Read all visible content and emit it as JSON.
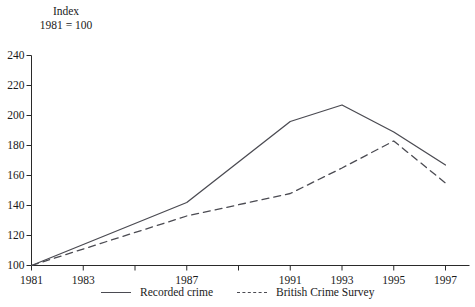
{
  "chart_data": {
    "type": "line",
    "title": "",
    "axis_title_lines": [
      "Index",
      "1981 = 100"
    ],
    "xlabel": "",
    "ylabel": "Index 1981 = 100",
    "ylim": [
      100,
      240
    ],
    "xlim": [
      1981,
      1997
    ],
    "grid": false,
    "legend_position": "bottom",
    "y_ticks": [
      240,
      220,
      200,
      180,
      160,
      140,
      120,
      100
    ],
    "x_ticks": [
      1981,
      1983,
      1985,
      1987,
      1989,
      1991,
      1993,
      1995,
      1997
    ],
    "x_tick_labels": [
      "1981",
      "1983",
      "1987",
      "1991",
      "1993",
      "1995",
      "1997"
    ],
    "x_labeled_years": [
      1981,
      1983,
      1987,
      1991,
      1993,
      1995,
      1997
    ],
    "series": [
      {
        "name": "Recorded crime",
        "style": "solid",
        "color": "#4b4b52",
        "x": [
          1981,
          1987,
          1991,
          1993,
          1995,
          1997
        ],
        "values": [
          100,
          142,
          196,
          207,
          189,
          167
        ]
      },
      {
        "name": "British Crime Survey",
        "style": "dashed",
        "color": "#4b4b52",
        "x": [
          1981,
          1987,
          1991,
          1993,
          1995,
          1997
        ],
        "values": [
          100,
          133,
          148,
          165,
          183,
          155
        ]
      }
    ]
  },
  "axis": {
    "title_line1": "Index",
    "title_line2": "1981 = 100",
    "y_labels": [
      "240",
      "220",
      "200",
      "180",
      "160",
      "140",
      "120",
      "100"
    ],
    "x_labels": [
      "1981",
      "1983",
      "1987",
      "1991",
      "1993",
      "1995",
      "1997"
    ]
  },
  "legend": {
    "items": [
      {
        "label": "Recorded crime",
        "style": "solid"
      },
      {
        "label": "British Crime Survey",
        "style": "dashed"
      }
    ]
  },
  "colors": {
    "line": "#4b4b52",
    "axis": "#2a2a2a",
    "text": "#1a1a1a",
    "background": "#ffffff"
  }
}
